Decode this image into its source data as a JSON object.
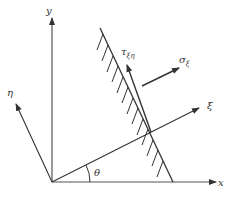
{
  "diagram": {
    "type": "stress-transformation-coordinate-diagram",
    "colors": {
      "stroke": "#333333",
      "background": "#ffffff"
    },
    "axes": {
      "x": {
        "label": "x"
      },
      "y": {
        "label": "y"
      },
      "xi": {
        "label": "ξ"
      },
      "eta": {
        "label": "η"
      }
    },
    "angle": {
      "label": "θ"
    },
    "stresses": {
      "shear": {
        "symbol": "τ",
        "subscript": "ξη"
      },
      "normal": {
        "symbol": "σ",
        "subscript": "ξ"
      }
    },
    "plane": {
      "description": "hatched inclined plane"
    }
  }
}
